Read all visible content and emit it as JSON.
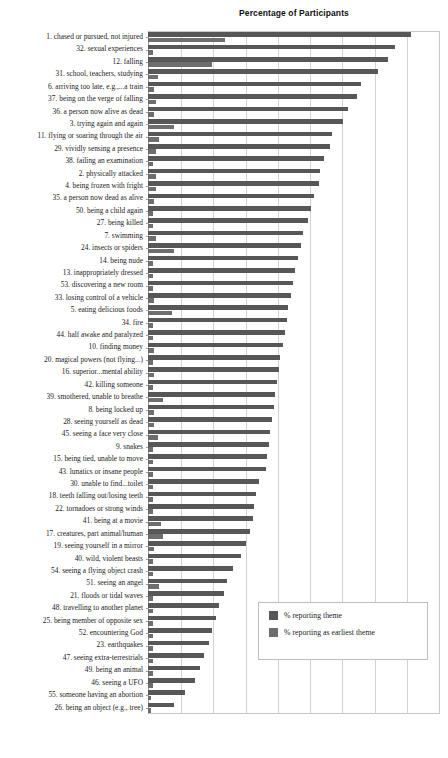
{
  "chart_data": {
    "type": "bar",
    "orientation": "horizontal",
    "title": "Percentage of Participants",
    "xlabel": "",
    "ylabel": "",
    "xlim": [
      0,
      90
    ],
    "xticks": [
      0,
      10,
      20,
      30,
      40,
      50,
      60,
      70,
      80,
      90
    ],
    "grid": true,
    "legend_position": "lower-right",
    "legend": [
      "% reporting theme",
      "% reporting as earliest theme"
    ],
    "series": [
      {
        "name": "% reporting theme",
        "color": "#575757",
        "values": [
          81.5,
          76.5,
          74.5,
          71.5,
          66.0,
          65.0,
          62.0,
          60.5,
          57.0,
          56.5,
          54.5,
          53.5,
          53.0,
          51.5,
          50.5,
          49.5,
          48.0,
          47.5,
          46.5,
          45.5,
          45.0,
          44.5,
          43.5,
          43.0,
          42.5,
          42.0,
          41.0,
          40.5,
          40.0,
          39.5,
          39.0,
          38.5,
          38.0,
          37.5,
          37.0,
          36.5,
          34.5,
          33.5,
          33.0,
          32.5,
          31.5,
          30.5,
          29.0,
          26.5,
          24.5,
          23.5,
          22.0,
          21.0,
          20.0,
          19.0,
          17.5,
          16.0,
          14.5,
          11.5,
          8.0
        ]
      },
      {
        "name": "% reporting as earliest theme",
        "color": "#6e6e6e",
        "values": [
          24.0,
          1.5,
          20.0,
          3.0,
          2.0,
          2.5,
          2.0,
          8.0,
          3.5,
          2.5,
          1.5,
          2.5,
          2.5,
          2.0,
          1.5,
          1.5,
          2.5,
          8.0,
          1.5,
          1.5,
          1.5,
          2.0,
          7.5,
          1.5,
          1.5,
          2.0,
          1.5,
          2.0,
          1.5,
          4.5,
          2.0,
          2.0,
          3.0,
          1.5,
          1.5,
          1.5,
          1.5,
          1.5,
          1.5,
          4.0,
          4.5,
          2.0,
          1.5,
          1.5,
          3.5,
          1.5,
          1.5,
          1.5,
          1.5,
          1.5,
          1.5,
          1.5,
          1.5,
          1.0,
          1.0
        ]
      }
    ],
    "categories": [
      "1. chased or pursued, not injured",
      "32. sexual experiences",
      "12. falling",
      "31. school, teachers, studying",
      "6. arriving too late, e.g.,...a train",
      "37. being on the verge of falling",
      "36. a person now alive as dead",
      "3. trying again and again",
      "11. flying or soaring through the air",
      "29. vividly sensing a presence",
      "38. failing an examination",
      "2. physically attacked",
      "4. being frozen with fright",
      "35. a person now dead as alive",
      "50. being a child again",
      "27. being killed",
      "7. swimming",
      "24. insects or spiders",
      "14. being nude",
      "13. inappropriately dressed",
      "53. discovering a new room",
      "33. losing control of a vehicle",
      "5. eating delicious foods",
      "34. fire",
      "44. half awake and paralyzed",
      "10. finding money",
      "20. magical powers (not flying...)",
      "16. superior...mental ability",
      "42. killing someone",
      "39. smothered, unable to breathe",
      "8. being locked up",
      "28. seeing yourself as dead",
      "45. seeing a face very close",
      "9. snakes",
      "15. being tied, unable to move",
      "43. lunatics or insane people",
      "30. unable to find...toilet",
      "18. teeth falling out/losing teeth",
      "22. tornadoes or strong winds",
      "41. being at a movie",
      "17. creatures, part animal/human",
      "19. seeing yourself in a mirror",
      "40. wild, violent beasts",
      "54. seeing a flying object crash",
      "51. seeing an angel",
      "21. floods or tidal waves",
      "48. travelling to another planet",
      "25. being member of opposite sex",
      "52. encountering God",
      "23. earthquakes",
      "47. seeing extra-terrestrials",
      "49. being an animal",
      "46. seeing a UFO",
      "55. someone having an abortion",
      "26. being an object (e.g., tree)"
    ]
  }
}
